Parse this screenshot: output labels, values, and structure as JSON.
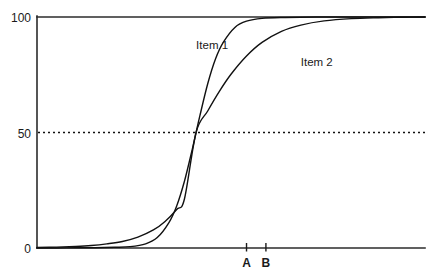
{
  "chart_data": {
    "type": "line",
    "title": "",
    "subtitle": "",
    "xlabel": "",
    "ylabel": "",
    "xlim": [
      0,
      100
    ],
    "ylim": [
      0,
      100
    ],
    "grid": false,
    "legend_position": "inline-annotation",
    "yticks": [
      {
        "value": 0,
        "label": "0"
      },
      {
        "value": 50,
        "label": "50"
      },
      {
        "value": 100,
        "label": "100"
      }
    ],
    "xticks": [
      {
        "value": 54,
        "label": "A"
      },
      {
        "value": 59,
        "label": "B"
      }
    ],
    "annotations": [
      {
        "name": "item-1-label",
        "text": "Item 1",
        "x": 41,
        "y": 86
      },
      {
        "name": "item-2-label",
        "text": "Item 2",
        "x": 68,
        "y": 79
      }
    ],
    "reference_lines": [
      {
        "name": "fifty-percent-line",
        "orientation": "horizontal",
        "value": 50,
        "style": "dashed"
      }
    ],
    "series": [
      {
        "name": "Item 1",
        "midpoint": 41,
        "slope": 0.3,
        "style": "solid",
        "color": "#111111",
        "points": [
          {
            "x": 0,
            "y": 0.0
          },
          {
            "x": 5,
            "y": 0.0
          },
          {
            "x": 10,
            "y": 0.1
          },
          {
            "x": 15,
            "y": 0.1
          },
          {
            "x": 20,
            "y": 0.3
          },
          {
            "x": 24,
            "y": 0.6
          },
          {
            "x": 28,
            "y": 1.8
          },
          {
            "x": 31,
            "y": 4.5
          },
          {
            "x": 34,
            "y": 11.0
          },
          {
            "x": 36,
            "y": 18.2
          },
          {
            "x": 38,
            "y": 28.9
          },
          {
            "x": 40,
            "y": 42.6
          },
          {
            "x": 41,
            "y": 50.0
          },
          {
            "x": 42,
            "y": 57.4
          },
          {
            "x": 44,
            "y": 71.1
          },
          {
            "x": 46,
            "y": 81.8
          },
          {
            "x": 48,
            "y": 89.0
          },
          {
            "x": 51,
            "y": 95.5
          },
          {
            "x": 54,
            "y": 98.2
          },
          {
            "x": 58,
            "y": 99.4
          },
          {
            "x": 64,
            "y": 99.8
          },
          {
            "x": 72,
            "y": 100.0
          },
          {
            "x": 85,
            "y": 100.0
          },
          {
            "x": 100,
            "y": 100.0
          }
        ]
      },
      {
        "name": "Item 2",
        "midpoint": 41,
        "slope": 0.115,
        "style": "solid",
        "color": "#111111",
        "points": [
          {
            "x": 0,
            "y": 0.2
          },
          {
            "x": 5,
            "y": 0.4
          },
          {
            "x": 10,
            "y": 0.7
          },
          {
            "x": 14,
            "y": 1.1
          },
          {
            "x": 18,
            "y": 1.8
          },
          {
            "x": 22,
            "y": 2.8
          },
          {
            "x": 26,
            "y": 4.7
          },
          {
            "x": 30,
            "y": 7.8
          },
          {
            "x": 33,
            "y": 11.5
          },
          {
            "x": 36,
            "y": 16.7
          },
          {
            "x": 38,
            "y": 21.2
          },
          {
            "x": 41,
            "y": 50.0
          },
          {
            "x": 44,
            "y": 59.3
          },
          {
            "x": 47,
            "y": 67.8
          },
          {
            "x": 50,
            "y": 75.2
          },
          {
            "x": 54,
            "y": 83.1
          },
          {
            "x": 58,
            "y": 89.0
          },
          {
            "x": 63,
            "y": 93.8
          },
          {
            "x": 68,
            "y": 96.5
          },
          {
            "x": 74,
            "y": 98.3
          },
          {
            "x": 81,
            "y": 99.3
          },
          {
            "x": 88,
            "y": 99.7
          },
          {
            "x": 94,
            "y": 99.9
          },
          {
            "x": 100,
            "y": 100.0
          }
        ]
      }
    ]
  },
  "axis_labels": {
    "y_top": "100",
    "y_mid": "50",
    "y_bottom": "0",
    "x_tick_a": "A",
    "x_tick_b": "B"
  },
  "series_labels": {
    "item1": "Item 1",
    "item2": "Item 2"
  }
}
